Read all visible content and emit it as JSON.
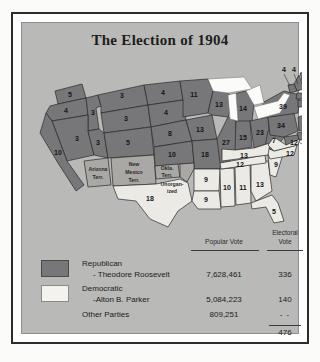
{
  "title": "The Election of 1904",
  "colors": {
    "republican": "#77777a",
    "democratic": "#eceae4",
    "territory": "#a9a8a4",
    "plate": "#b9b9b7",
    "frame": "#2c2c2c"
  },
  "table": {
    "col_popular": "Popular Vote",
    "col_electoral_line1": "Electoral",
    "col_electoral_line2": "Vote",
    "rows": [
      {
        "party": "Republican",
        "candidate": "- Theodore Roosevelt",
        "popular_vote": "7,628,461",
        "electoral_vote": "336",
        "swatch": "republican"
      },
      {
        "party": "Democratic",
        "candidate": "-Alton B. Parker",
        "popular_vote": "5,084,223",
        "electoral_vote": "140",
        "swatch": "democratic"
      },
      {
        "party": "Other Parties",
        "candidate": "",
        "popular_vote": "809,251",
        "electoral_vote": "- -",
        "swatch": "none"
      }
    ],
    "total_electoral": "476"
  },
  "map": {
    "split_state_box": {
      "line1": "TR 1",
      "line2": "AP 7"
    },
    "territories": [
      {
        "name": "Arizona Terr.",
        "lines": [
          "Arizona",
          "Terr."
        ]
      },
      {
        "name": "New Mexico Terr.",
        "lines": [
          "New",
          "Mexico",
          "Terr."
        ]
      },
      {
        "name": "Okla. Terr.",
        "lines": [
          "Okla.",
          "Terr."
        ]
      },
      {
        "name": "Unorganized",
        "lines": [
          "Unorgan-",
          "ized"
        ]
      }
    ],
    "states": [
      {
        "name": "Washington",
        "votes": "5",
        "party": "republican"
      },
      {
        "name": "Oregon",
        "votes": "4",
        "party": "republican"
      },
      {
        "name": "Idaho",
        "votes": "3",
        "party": "republican"
      },
      {
        "name": "Montana",
        "votes": "3",
        "party": "republican"
      },
      {
        "name": "Wyoming",
        "votes": "3",
        "party": "republican"
      },
      {
        "name": "Nevada",
        "votes": "3",
        "party": "republican"
      },
      {
        "name": "Utah",
        "votes": "3",
        "party": "republican"
      },
      {
        "name": "California",
        "votes": "10",
        "party": "republican"
      },
      {
        "name": "Colorado",
        "votes": "5",
        "party": "republican"
      },
      {
        "name": "North Dakota",
        "votes": "4",
        "party": "republican"
      },
      {
        "name": "South Dakota",
        "votes": "4",
        "party": "republican"
      },
      {
        "name": "Nebraska",
        "votes": "8",
        "party": "republican"
      },
      {
        "name": "Kansas",
        "votes": "10",
        "party": "republican"
      },
      {
        "name": "Minnesota",
        "votes": "11",
        "party": "republican"
      },
      {
        "name": "Iowa",
        "votes": "13",
        "party": "republican"
      },
      {
        "name": "Wisconsin",
        "votes": "13",
        "party": "republican"
      },
      {
        "name": "Missouri",
        "votes": "18",
        "party": "republican"
      },
      {
        "name": "Illinois",
        "votes": "27",
        "party": "republican"
      },
      {
        "name": "Michigan",
        "votes": "14",
        "party": "republican"
      },
      {
        "name": "Indiana",
        "votes": "15",
        "party": "republican"
      },
      {
        "name": "Ohio",
        "votes": "23",
        "party": "republican"
      },
      {
        "name": "West Virginia",
        "votes": "7",
        "party": "republican"
      },
      {
        "name": "Pennsylvania",
        "votes": "34",
        "party": "republican"
      },
      {
        "name": "New York",
        "votes": "39",
        "party": "republican"
      },
      {
        "name": "Maine",
        "votes": "6",
        "party": "republican"
      },
      {
        "name": "New Hampshire",
        "votes": "4",
        "party": "republican"
      },
      {
        "name": "Vermont",
        "votes": "4",
        "party": "republican"
      },
      {
        "name": "Massachusetts",
        "votes": "16",
        "party": "republican"
      },
      {
        "name": "Rhode Island",
        "votes": "4",
        "party": "republican"
      },
      {
        "name": "Connecticut",
        "votes": "7",
        "party": "republican"
      },
      {
        "name": "New Jersey",
        "votes": "12",
        "party": "republican"
      },
      {
        "name": "Delaware",
        "votes": "3",
        "party": "republican"
      },
      {
        "name": "Texas",
        "votes": "18",
        "party": "democratic"
      },
      {
        "name": "Arkansas",
        "votes": "9",
        "party": "democratic"
      },
      {
        "name": "Louisiana",
        "votes": "9",
        "party": "democratic"
      },
      {
        "name": "Mississippi",
        "votes": "10",
        "party": "democratic"
      },
      {
        "name": "Alabama",
        "votes": "11",
        "party": "democratic"
      },
      {
        "name": "Georgia",
        "votes": "13",
        "party": "democratic"
      },
      {
        "name": "Florida",
        "votes": "5",
        "party": "democratic"
      },
      {
        "name": "South Carolina",
        "votes": "9",
        "party": "democratic"
      },
      {
        "name": "North Carolina",
        "votes": "12",
        "party": "democratic"
      },
      {
        "name": "Tennessee",
        "votes": "12",
        "party": "democratic"
      },
      {
        "name": "Kentucky",
        "votes": "13",
        "party": "democratic"
      },
      {
        "name": "Virginia",
        "votes": "12",
        "party": "democratic"
      }
    ]
  }
}
